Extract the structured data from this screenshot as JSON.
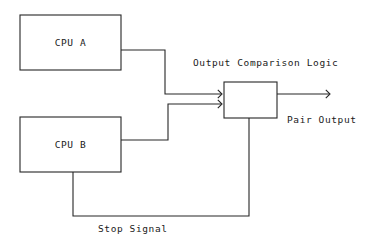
{
  "diagram": {
    "type": "block-diagram",
    "canvas": {
      "width": 375,
      "height": 244,
      "background": "#ffffff"
    },
    "stroke_color": "#262626",
    "text_color": "#1a1a1a",
    "blocks": [
      {
        "id": "cpu-a",
        "label": "CPU A",
        "x": 20,
        "y": 15,
        "width": 101,
        "height": 55
      },
      {
        "id": "cpu-b",
        "label": "CPU B",
        "x": 20,
        "y": 117,
        "width": 101,
        "height": 55
      },
      {
        "id": "comparison-logic",
        "label": "",
        "x": 224,
        "y": 82,
        "width": 53,
        "height": 36
      }
    ],
    "labels": [
      {
        "id": "comparison-logic-caption",
        "text": "Output Comparison Logic",
        "x": 193,
        "y": 66,
        "anchor": "start"
      },
      {
        "id": "pair-output-caption",
        "text": "Pair Output",
        "x": 287,
        "y": 123,
        "anchor": "start"
      },
      {
        "id": "stop-signal-caption",
        "text": "Stop Signal",
        "x": 98,
        "y": 232,
        "anchor": "start"
      }
    ],
    "connections": [
      {
        "id": "cpu-a-to-comparator",
        "from": "cpu-a",
        "to": "comparison-logic",
        "path": "M121,50 L165,50 L165,94 L221,94",
        "arrow": {
          "x": 222,
          "y": 94
        }
      },
      {
        "id": "cpu-b-to-comparator",
        "from": "cpu-b",
        "to": "comparison-logic",
        "path": "M121,140 L168,140 L168,104 L221,104",
        "arrow": {
          "x": 222,
          "y": 104
        }
      },
      {
        "id": "comparator-to-pair-output",
        "from": "comparison-logic",
        "to": "pair-output",
        "path": "M277,94 L329,94",
        "arrow": {
          "x": 330,
          "y": 94
        }
      },
      {
        "id": "stop-signal-feedback",
        "from": "cpu-b",
        "to": "comparison-logic",
        "path": "M73,172 L73,216 L249,216 L249,118",
        "arrow": null
      }
    ]
  }
}
